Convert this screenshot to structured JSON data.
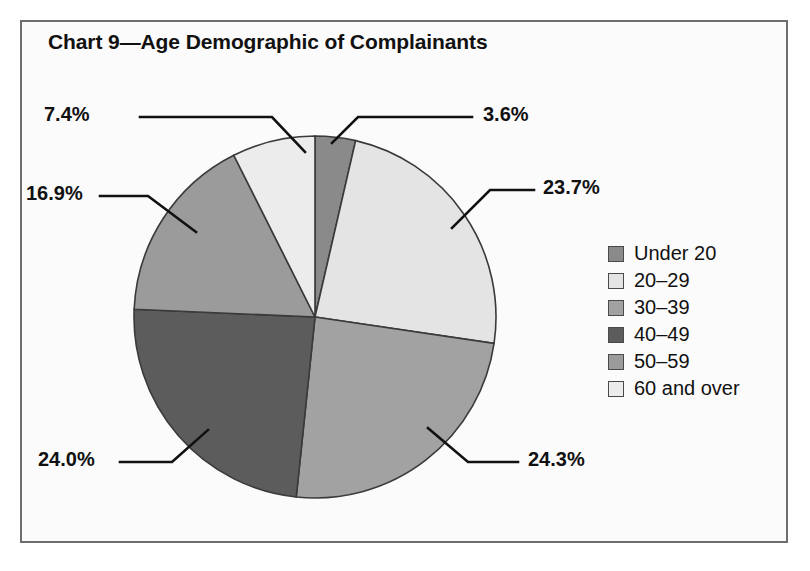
{
  "chart_data": {
    "type": "pie",
    "title": "Chart 9—Age Demographic of Complainants",
    "xlabel": "",
    "ylabel": "",
    "legend_position": "right",
    "grid": false,
    "categories": [
      "Under 20",
      "20–29",
      "30–39",
      "40–49",
      "50–59",
      "60 and over"
    ],
    "values": [
      3.6,
      23.7,
      24.3,
      24.0,
      16.9,
      7.4
    ],
    "value_labels": [
      "3.6%",
      "23.7%",
      "24.3%",
      "24.0%",
      "16.9%",
      "7.4%"
    ],
    "units": "percent",
    "colors": [
      "#8a8a8a",
      "#e4e4e4",
      "#a2a2a2",
      "#5c5c5c",
      "#9b9b9b",
      "#ececec"
    ],
    "start_angle_deg": 0,
    "direction": "clockwise",
    "slices": [
      {
        "label": "Under 20",
        "value": 3.6,
        "display": "3.6%",
        "color": "#8a8a8a"
      },
      {
        "label": "20–29",
        "value": 23.7,
        "display": "23.7%",
        "color": "#e4e4e4"
      },
      {
        "label": "30–39",
        "value": 24.3,
        "display": "24.3%",
        "color": "#a2a2a2"
      },
      {
        "label": "40–49",
        "value": 24.0,
        "display": "24.0%",
        "color": "#5c5c5c"
      },
      {
        "label": "50–59",
        "value": 16.9,
        "display": "16.9%",
        "color": "#9b9b9b"
      },
      {
        "label": "60 and over",
        "value": 7.4,
        "display": "7.4%",
        "color": "#ececec"
      }
    ]
  },
  "frame": {
    "border_color": "#6e6e72",
    "background": "#fbfbfb"
  },
  "labels": {
    "top_left": "7.4%",
    "top_right": "3.6%",
    "mid_left": "16.9%",
    "mid_right": "23.7%",
    "bottom_left": "24.0%",
    "bottom_right": "24.3%"
  }
}
